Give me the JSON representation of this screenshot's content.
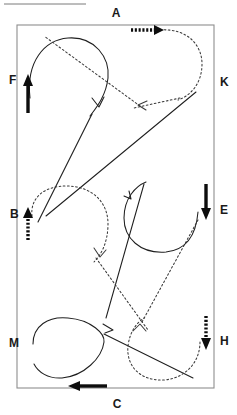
{
  "figure": {
    "title": "",
    "type": "path-trajectory-diagram",
    "canvas": {
      "width": 237,
      "height": 415
    },
    "background_color": "#ffffff"
  },
  "colors": {
    "boundary": "#8e8e8e",
    "solid_path": "#1f1f1f",
    "dotted_path": "#3a3a3a",
    "bold_arrow": "#0d0d0d",
    "label": "#1a1a1a"
  },
  "boundary": {
    "name": "rectangle-field",
    "x": 17,
    "y": 25,
    "width": 197,
    "height": 363
  },
  "labels": [
    {
      "id": "A",
      "text": "A",
      "x": 116,
      "y": 17,
      "side": "top"
    },
    {
      "id": "K",
      "text": "K",
      "x": 220,
      "y": 86,
      "side": "right"
    },
    {
      "id": "E",
      "text": "E",
      "x": 220,
      "y": 214,
      "side": "right"
    },
    {
      "id": "H",
      "text": "H",
      "x": 220,
      "y": 345,
      "side": "right"
    },
    {
      "id": "C",
      "text": "C",
      "x": 117,
      "y": 408,
      "side": "bottom"
    },
    {
      "id": "M",
      "text": "M",
      "x": 9,
      "y": 347,
      "side": "left"
    },
    {
      "id": "B",
      "text": "B",
      "x": 10,
      "y": 218,
      "side": "left"
    },
    {
      "id": "F",
      "text": "F",
      "x": 9,
      "y": 84,
      "side": "left"
    }
  ],
  "boundary_arrows": [
    {
      "id": "arrow-A",
      "at_label": "A",
      "style": "dotted",
      "weight": "bold",
      "direction": "right",
      "description": "dotted bold arrow pointing right along the top edge"
    },
    {
      "id": "arrow-F",
      "at_label": "F",
      "style": "solid",
      "weight": "bold",
      "direction": "up",
      "description": "solid bold arrow pointing up along the left edge"
    },
    {
      "id": "arrow-B",
      "at_label": "B",
      "style": "dotted",
      "weight": "bold",
      "direction": "up",
      "description": "dotted bold arrow pointing up along the left edge"
    },
    {
      "id": "arrow-E",
      "at_label": "E",
      "style": "solid",
      "weight": "bold",
      "direction": "down",
      "description": "solid bold arrow pointing down along the right edge"
    },
    {
      "id": "arrow-H",
      "at_label": "H",
      "style": "dotted",
      "weight": "bold",
      "direction": "down",
      "description": "dotted bold arrow pointing down along the right edge"
    },
    {
      "id": "arrow-C",
      "at_label": "C",
      "style": "solid",
      "weight": "bold",
      "direction": "left",
      "description": "solid bold arrow pointing left along the bottom edge"
    }
  ],
  "paths": {
    "solid": {
      "name": "solid-trajectory",
      "style": "solid",
      "stroke": "#1f1f1f",
      "segments": [
        {
          "id": "solid-loop-F",
          "d": "M 30,98 C 26,62 44,40 68,38 C 95,36 110,58 108,78 C 106,96 96,108 90,116"
        },
        {
          "id": "solid-diag-1",
          "d": "M 92,114 L 38,222"
        },
        {
          "id": "solid-diag-2",
          "d": "M 46,216 L 196,92"
        },
        {
          "id": "solid-loop-E",
          "d": "M 198,212 C 196,236 186,250 166,252 C 140,254 124,238 124,218 C 124,198 136,186 146,182"
        },
        {
          "id": "solid-diag-3",
          "d": "M 144,184 L 106,318"
        },
        {
          "id": "solid-loop-M",
          "d": "M 33,344 C 33,326 48,316 68,318 C 92,320 105,334 104,342 C 102,358 84,376 62,378 C 48,379 38,372 34,364"
        },
        {
          "id": "solid-diag-4",
          "d": "M 104,334 L 193,378"
        }
      ],
      "arrowheads": [
        {
          "id": "solid-head-1",
          "x": 98,
          "y": 105,
          "angle": 118
        },
        {
          "id": "solid-head-2",
          "x": 131,
          "y": 199,
          "angle": -39
        },
        {
          "id": "solid-head-3",
          "x": 112,
          "y": 329,
          "angle": 27
        }
      ]
    },
    "dotted": {
      "name": "dotted-trajectory",
      "style": "dotted",
      "stroke": "#3a3a3a",
      "segments": [
        {
          "id": "dotted-loop-A",
          "d": "M 160,30 C 186,28 202,44 202,64 C 202,84 190,96 178,100"
        },
        {
          "id": "dotted-diag-1",
          "d": "M 180,98 L 134,108"
        },
        {
          "id": "dotted-diag-2",
          "d": "M 140,106 L 44,36"
        },
        {
          "id": "dotted-loop-B",
          "d": "M 32,216 C 30,198 44,186 66,186 C 92,186 108,202 108,224 C 108,244 100,256 94,262"
        },
        {
          "id": "dotted-diag-3",
          "d": "M 96,258 L 148,330"
        },
        {
          "id": "dotted-loop-H",
          "d": "M 200,342 C 200,362 186,378 164,380 C 140,381 126,366 128,346 C 130,330 138,322 144,318"
        },
        {
          "id": "dotted-diag-4",
          "d": "M 142,322 L 198,220"
        }
      ],
      "arrowheads": [
        {
          "id": "dotted-head-1",
          "x": 139,
          "y": 105,
          "angle": 192
        },
        {
          "id": "dotted-head-2",
          "x": 100,
          "y": 247,
          "angle": 62
        },
        {
          "id": "dotted-head-3",
          "x": 140,
          "y": 333,
          "angle": -62
        }
      ]
    }
  },
  "artifacts": [
    {
      "id": "top-scan-line",
      "x1": 4,
      "y1": 4,
      "x2": 86,
      "y2": 4
    }
  ]
}
